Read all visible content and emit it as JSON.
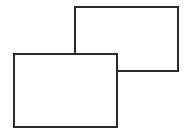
{
  "diagram": {
    "stroke_color": "#2a2a2a",
    "fill_color": "#ffffff",
    "shapes": [
      {
        "id": "back-rectangle",
        "x": 74,
        "y": 6,
        "width": 105,
        "height": 66
      },
      {
        "id": "front-rectangle",
        "x": 13,
        "y": 53,
        "width": 105,
        "height": 75
      }
    ]
  }
}
